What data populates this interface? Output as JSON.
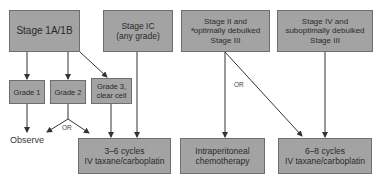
{
  "diagram": {
    "stages": {
      "stage_1a_1b": "Stage 1A/1B",
      "stage_ic": [
        "Stage IC",
        "(any grade)"
      ],
      "stage_ii": [
        "Stage II and",
        "ᵃoptimally debulked",
        "Stage III"
      ],
      "stage_iv": [
        "Stage IV and",
        "suboptimally debulked",
        "Stage III"
      ]
    },
    "grades": {
      "grade_1": "Grade 1",
      "grade_2": "Grade 2",
      "grade_3": [
        "Grade 3,",
        "clear cell"
      ]
    },
    "outcomes": {
      "observe": "Observe",
      "cycles_3_6": [
        "3–6 cycles",
        "IV taxane/carboplatin"
      ],
      "intraperitoneal": [
        "Intraperitoneal",
        "chemotherapy"
      ],
      "cycles_6_8": [
        "6–8 cycles",
        "IV taxane/carboplatin"
      ]
    },
    "connector_labels": {
      "or_grade2": "OR",
      "or_stage2": "OR"
    },
    "colors": {
      "box_fill": "#a3a3a3",
      "box_border": "#6e6e6e",
      "line": "#333333"
    }
  }
}
